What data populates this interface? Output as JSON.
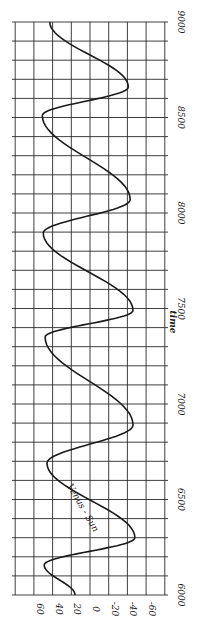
{
  "chart_data": {
    "type": "line",
    "orientation": "rotated-90",
    "title": "",
    "xlabel": "time",
    "ylabel": "",
    "xlim": [
      6000,
      9000
    ],
    "ylim": [
      -70,
      75
    ],
    "x_ticks": [
      "6000",
      "6500",
      "7000",
      "7500",
      "8000",
      "8500",
      "9000"
    ],
    "y_ticks": [
      "60",
      "40",
      "20",
      "0",
      "-20",
      "-40",
      "-60"
    ],
    "grid": true,
    "annotations": [
      "Venus - Sun"
    ],
    "series": [
      {
        "name": "Venus - Sun",
        "x": [
          6000,
          6157,
          6300,
          6690,
          6890,
          7350,
          7490,
          7895,
          8070,
          8510,
          8660,
          9000
        ],
        "values": [
          16,
          49,
          -48,
          46,
          -46,
          48,
          -46,
          50,
          -43,
          51,
          -41,
          43
        ]
      }
    ]
  }
}
